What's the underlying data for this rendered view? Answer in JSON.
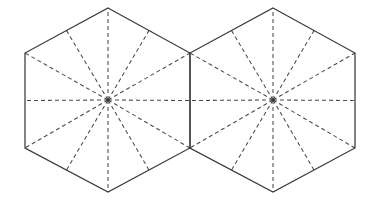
{
  "figure": {
    "background_color": "#ffffff",
    "outline_color": "#3a3a3c",
    "spoke_color": "#4a4a4c",
    "outline_width": 1.25,
    "spoke_width": 1.05,
    "spoke_dash": "4 3",
    "canvas": {
      "width": 372,
      "height": 210
    },
    "shape_type": "hexagon",
    "shape_count": 2,
    "orientation": "pointy-top",
    "spokes_per_shape": 12,
    "spoke_angle_step_degrees": 30,
    "shared_edge": true,
    "shapes": [
      {
        "name": "left-hexagon",
        "center": {
          "x": 108,
          "y": 100
        },
        "circumradius": 94,
        "vertices": [
          {
            "x": 108,
            "y": 8
          },
          {
            "x": 190,
            "y": 53
          },
          {
            "x": 190,
            "y": 148
          },
          {
            "x": 108,
            "y": 192
          },
          {
            "x": 25,
            "y": 148
          },
          {
            "x": 25,
            "y": 53
          }
        ]
      },
      {
        "name": "right-hexagon",
        "center": {
          "x": 273,
          "y": 100
        },
        "circumradius": 94,
        "vertices": [
          {
            "x": 273,
            "y": 8
          },
          {
            "x": 355,
            "y": 53
          },
          {
            "x": 355,
            "y": 148
          },
          {
            "x": 273,
            "y": 192
          },
          {
            "x": 190,
            "y": 148
          },
          {
            "x": 190,
            "y": 53
          }
        ]
      }
    ]
  }
}
